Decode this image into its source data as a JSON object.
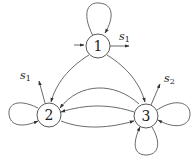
{
  "diagram": {
    "type": "state-transition-graph",
    "nodes": [
      {
        "id": "1",
        "label": "1"
      },
      {
        "id": "2",
        "label": "2"
      },
      {
        "id": "3",
        "label": "3"
      }
    ],
    "output_labels": {
      "node1": {
        "base": "s",
        "sub": "1"
      },
      "node2": {
        "base": "s",
        "sub": "1"
      },
      "node3": {
        "base": "s",
        "sub": "2"
      }
    },
    "edges": [
      {
        "from": "1",
        "to": "1",
        "kind": "self-loop"
      },
      {
        "from": "input",
        "to": "1",
        "kind": "entry"
      },
      {
        "from": "1",
        "to": "s1",
        "kind": "output"
      },
      {
        "from": "1",
        "to": "2"
      },
      {
        "from": "1",
        "to": "3"
      },
      {
        "from": "2",
        "to": "2",
        "kind": "self-loop"
      },
      {
        "from": "2",
        "to": "s1",
        "kind": "output"
      },
      {
        "from": "2",
        "to": "3"
      },
      {
        "from": "3",
        "to": "2",
        "kind": "upper arc"
      },
      {
        "from": "3",
        "to": "2",
        "kind": "middle arc"
      },
      {
        "from": "3",
        "to": "3",
        "kind": "self-loop right"
      },
      {
        "from": "3",
        "to": "3",
        "kind": "self-loop bottom"
      },
      {
        "from": "3",
        "to": "s2",
        "kind": "output"
      }
    ],
    "stroke_color": "#333333"
  }
}
